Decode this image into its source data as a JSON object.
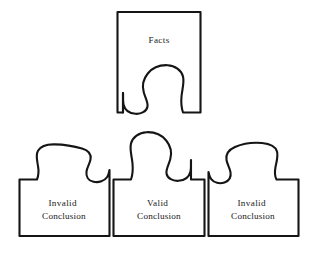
{
  "diagram": {
    "name": "puzzle-piece-logic-diagram",
    "background_color": "#ffffff",
    "stroke_color": "#151515",
    "text_color": "#1a1a1a",
    "pieces": {
      "top": {
        "id": "facts-piece",
        "label": "Facts",
        "label_lines": [
          "Facts"
        ],
        "connector": "socket",
        "connector_position": "bottom-center"
      },
      "bottom_left": {
        "id": "invalid-conclusion-left-piece",
        "label": "Invalid Conclusion",
        "label_lines": [
          "Invalid",
          "Conclusion"
        ],
        "connector": "tab",
        "connector_position": "top-right-of-center",
        "fit": "no"
      },
      "bottom_center": {
        "id": "valid-conclusion-piece",
        "label": "Valid Conclusion",
        "label_lines": [
          "Valid",
          "Conclusion"
        ],
        "connector": "tab",
        "connector_position": "top-center",
        "fit": "yes"
      },
      "bottom_right": {
        "id": "invalid-conclusion-right-piece",
        "label": "Invalid Conclusion",
        "label_lines": [
          "Invalid",
          "Conclusion"
        ],
        "connector": "tab",
        "connector_position": "top-left-of-center",
        "fit": "no"
      }
    }
  }
}
